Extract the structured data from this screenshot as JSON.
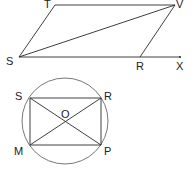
{
  "figures": {
    "parallelogram": {
      "labels": {
        "T": "T",
        "V": "V",
        "S": "S",
        "R": "R",
        "X": "X"
      }
    },
    "inscribed_rectangle": {
      "labels": {
        "S": "S",
        "R": "R",
        "O": "O",
        "M": "M",
        "P": "P"
      }
    }
  },
  "colors": {
    "stroke": "#2a2a2a",
    "circle": "#555555",
    "background": "#ffffff"
  }
}
